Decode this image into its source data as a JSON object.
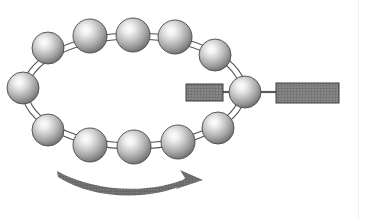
{
  "figure": {
    "canvas": {
      "width": 366,
      "height": 219,
      "background": "#ffffff"
    },
    "page_edge": {
      "x": 358,
      "color": "#efefef"
    }
  },
  "ring": {
    "name": "double-ellipse-ring",
    "center_x": 134,
    "center_y": 91,
    "outer_rx": 112,
    "outer_ry": 58,
    "inner_rx": 106,
    "inner_ry": 52,
    "stroke": "#555555",
    "stroke_width": 1.1,
    "fill": "none"
  },
  "spheres": {
    "count": 12,
    "radius": 16,
    "highlight_color": "#f2f2f2",
    "mid_color": "#b8b8b8",
    "edge_color": "#6e6e6e",
    "outline_color": "#4a4a4a",
    "items": [
      {
        "id": "sphere-left",
        "label": "left",
        "cx": 23,
        "cy": 88,
        "r": 16
      },
      {
        "id": "sphere-top-1",
        "label": "upper-left",
        "cx": 48,
        "cy": 48,
        "r": 16
      },
      {
        "id": "sphere-top-2",
        "label": "top-left",
        "cx": 90,
        "cy": 36,
        "r": 17
      },
      {
        "id": "sphere-top-3",
        "label": "top-center",
        "cx": 133,
        "cy": 35,
        "r": 17
      },
      {
        "id": "sphere-top-4",
        "label": "top-right",
        "cx": 175,
        "cy": 37,
        "r": 17
      },
      {
        "id": "sphere-top-5",
        "label": "upper-right",
        "cx": 215,
        "cy": 55,
        "r": 16
      },
      {
        "id": "sphere-right",
        "label": "right-anchor",
        "cx": 245,
        "cy": 92,
        "r": 16
      },
      {
        "id": "sphere-bottom-5",
        "label": "lower-right",
        "cx": 218,
        "cy": 128,
        "r": 16
      },
      {
        "id": "sphere-bottom-4",
        "label": "bottom-right",
        "cx": 178,
        "cy": 142,
        "r": 17
      },
      {
        "id": "sphere-bottom-3",
        "label": "bottom-center",
        "cx": 134,
        "cy": 147,
        "r": 17
      },
      {
        "id": "sphere-bottom-2",
        "label": "bottom-left",
        "cx": 90,
        "cy": 145,
        "r": 17
      },
      {
        "id": "sphere-bottom-1",
        "label": "lower-left",
        "cx": 48,
        "cy": 130,
        "r": 16
      }
    ]
  },
  "blocks": {
    "fill": "#7b7b7b",
    "stroke": "#3d3d3d",
    "connector_color": "#5a5a5a",
    "items": [
      {
        "id": "block-inner",
        "label": "inner-block",
        "x": 186,
        "y": 84,
        "width": 37,
        "height": 17
      },
      {
        "id": "block-outer",
        "label": "outer-block",
        "x": 276,
        "y": 83,
        "width": 63,
        "height": 20
      }
    ],
    "connectors": [
      {
        "id": "connector-inner",
        "x1": 223,
        "y1": 92,
        "x2": 232,
        "y2": 92
      },
      {
        "id": "connector-outer",
        "x1": 258,
        "y1": 92,
        "x2": 276,
        "y2": 92
      }
    ]
  },
  "arrow": {
    "name": "rotation-direction-arrow",
    "color": "#6b6b6b",
    "description": "curved arrow sweeping left to right beneath the ring",
    "start_x": 57,
    "start_y": 172,
    "end_x": 200,
    "end_y": 180,
    "control_x": 128,
    "control_y": 196,
    "head_length": 17,
    "head_width": 15
  }
}
